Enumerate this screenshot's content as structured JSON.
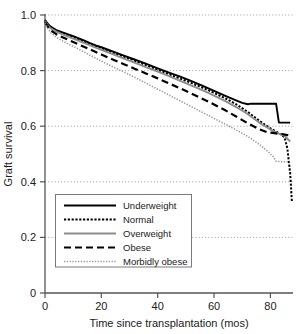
{
  "chart_data": {
    "type": "line",
    "title": "",
    "subtitle": "",
    "xlabel": "Time since transplantation (mos)",
    "ylabel": "Graft survival",
    "xlim": [
      0,
      88
    ],
    "ylim": [
      0,
      1.0
    ],
    "xticks": [
      0,
      20,
      40,
      60,
      80
    ],
    "xtick_labels": [
      "0",
      "20",
      "40",
      "60",
      "80"
    ],
    "yticks": [
      0,
      0.2,
      0.4,
      0.6,
      0.8,
      1.0
    ],
    "ytick_labels": [
      "0",
      "0.2",
      "0.4",
      "0.6",
      "0.8",
      "1.0"
    ],
    "grid": "horizontal-dotted",
    "legend_position": "lower-left-inside",
    "series": [
      {
        "name": "Underweight",
        "style": "solid",
        "color": "#000000",
        "width": 1.9,
        "x": [
          0,
          1,
          2,
          4,
          6,
          8,
          10,
          12,
          14,
          16,
          18,
          20,
          24,
          28,
          32,
          36,
          40,
          44,
          48,
          52,
          56,
          60,
          64,
          68,
          70,
          72,
          73,
          78,
          82,
          83,
          86,
          87
        ],
        "y": [
          0.982,
          0.968,
          0.958,
          0.946,
          0.938,
          0.931,
          0.924,
          0.916,
          0.908,
          0.899,
          0.891,
          0.884,
          0.869,
          0.854,
          0.839,
          0.824,
          0.808,
          0.793,
          0.778,
          0.762,
          0.745,
          0.727,
          0.709,
          0.692,
          0.684,
          0.679,
          0.681,
          0.681,
          0.681,
          0.613,
          0.613,
          0.613
        ]
      },
      {
        "name": "Normal",
        "style": "dotted-heavy",
        "color": "#000000",
        "width": 2.0,
        "x": [
          0,
          1,
          2,
          4,
          6,
          8,
          10,
          12,
          14,
          16,
          18,
          20,
          24,
          28,
          32,
          36,
          40,
          44,
          48,
          52,
          56,
          60,
          64,
          68,
          72,
          76,
          80,
          83,
          85,
          86,
          87,
          87.6
        ],
        "y": [
          0.98,
          0.966,
          0.955,
          0.943,
          0.935,
          0.928,
          0.92,
          0.912,
          0.904,
          0.896,
          0.888,
          0.88,
          0.865,
          0.85,
          0.835,
          0.819,
          0.803,
          0.787,
          0.771,
          0.755,
          0.738,
          0.72,
          0.7,
          0.678,
          0.651,
          0.62,
          0.592,
          0.575,
          0.56,
          0.52,
          0.43,
          0.33
        ]
      },
      {
        "name": "Overweight",
        "style": "solid",
        "color": "#8c8c8c",
        "width": 1.9,
        "x": [
          0,
          1,
          2,
          4,
          6,
          8,
          10,
          12,
          14,
          16,
          18,
          20,
          24,
          28,
          32,
          36,
          40,
          44,
          48,
          52,
          56,
          60,
          64,
          68,
          72,
          76,
          80,
          83,
          85,
          86,
          87
        ],
        "y": [
          0.978,
          0.963,
          0.952,
          0.94,
          0.931,
          0.923,
          0.915,
          0.907,
          0.899,
          0.891,
          0.883,
          0.875,
          0.859,
          0.843,
          0.828,
          0.812,
          0.796,
          0.78,
          0.763,
          0.746,
          0.729,
          0.71,
          0.69,
          0.668,
          0.643,
          0.613,
          0.588,
          0.573,
          0.565,
          0.555,
          0.545
        ]
      },
      {
        "name": "Obese",
        "style": "dashed",
        "color": "#000000",
        "width": 2.2,
        "x": [
          0,
          1,
          2,
          4,
          6,
          8,
          10,
          12,
          14,
          16,
          18,
          20,
          24,
          28,
          32,
          36,
          40,
          44,
          48,
          52,
          56,
          60,
          64,
          68,
          72,
          76,
          79,
          82,
          84,
          86,
          87
        ],
        "y": [
          0.975,
          0.958,
          0.945,
          0.931,
          0.921,
          0.912,
          0.903,
          0.894,
          0.885,
          0.876,
          0.867,
          0.858,
          0.84,
          0.823,
          0.806,
          0.789,
          0.772,
          0.754,
          0.736,
          0.717,
          0.698,
          0.678,
          0.657,
          0.634,
          0.61,
          0.589,
          0.578,
          0.574,
          0.572,
          0.568,
          0.56
        ]
      },
      {
        "name": "Morbidly obese",
        "style": "dotted-light",
        "color": "#9a9a9a",
        "width": 1.6,
        "x": [
          0,
          1,
          2,
          4,
          6,
          8,
          10,
          12,
          14,
          16,
          18,
          20,
          24,
          28,
          32,
          36,
          40,
          44,
          48,
          52,
          56,
          60,
          64,
          68,
          72,
          76,
          79,
          81,
          82,
          84,
          86,
          87
        ],
        "y": [
          0.972,
          0.952,
          0.937,
          0.92,
          0.908,
          0.897,
          0.887,
          0.877,
          0.866,
          0.855,
          0.845,
          0.834,
          0.814,
          0.795,
          0.775,
          0.754,
          0.733,
          0.712,
          0.691,
          0.67,
          0.649,
          0.628,
          0.607,
          0.586,
          0.563,
          0.535,
          0.51,
          0.49,
          0.474,
          0.472,
          0.472,
          0.472
        ]
      }
    ]
  },
  "legend": {
    "items": [
      {
        "label": "Underweight"
      },
      {
        "label": "Normal"
      },
      {
        "label": "Overweight"
      },
      {
        "label": "Obese"
      },
      {
        "label": "Morbidly obese"
      }
    ]
  },
  "axes": {
    "x_title": "Time since transplantation (mos)",
    "y_title": "Graft survival",
    "x_tick_labels": [
      "0",
      "20",
      "40",
      "60",
      "80"
    ],
    "y_tick_labels": [
      "1.0",
      "0.8",
      "0.6",
      "0.4",
      "0.2",
      "0"
    ]
  },
  "colors": {
    "axis": "#555555",
    "grid": "#9b9b9b",
    "black_series": "#000000",
    "gray_series": "#8c8c8c",
    "light_gray_series": "#9a9a9a",
    "legend_border": "#7a7a7a",
    "text": "#1a1a1a"
  }
}
